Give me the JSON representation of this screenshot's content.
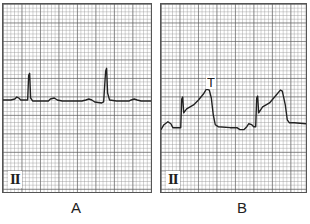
{
  "figure": {
    "panels": [
      {
        "id": "A",
        "caption": "A",
        "lead": "II",
        "trace_description": "Normal sinus rhythm: flat baseline with narrow QRS spikes, small P and T waves",
        "trace_points": "0,97 8,97 12,96 14,94 16,95 18,97 23,97 25,97 26,72 27,70 28,95 30,98 36,98 46,98 48,96 52,95 55,97 60,98 80,98 84,97 87,96 90,97 93,99 100,100 102,99 104,68 105,65 106,90 108,97 115,98 128,98 130,97 133,96 136,97 140,98 150,98",
        "stroke": "#222222"
      },
      {
        "id": "B",
        "caption": "B",
        "lead": "II",
        "annotation": "T",
        "trace_description": "Peaked/hyperacute T waves: QRS spikes followed by elevated ST segments rising into tall broad T waves",
        "trace_points": "0,127 3,122 7,119 10,121 12,125 18,125 20,125 21,96 22,94 23,110 26,106 33,102 38,97 43,91 46,86 49,87 51,95 53,112 55,122 58,124 70,125 77,125 80,127 84,127 87,124 89,121 92,122 94,124 96,124 97,95 98,93 99,110 103,104 110,100 116,93 121,87 123,88 126,102 128,117 130,120 135,120 147,121",
        "stroke": "#222222"
      }
    ],
    "grid": {
      "minor_px": 3.7,
      "major_px": 18.5,
      "minor_color": "#9a9a9a",
      "major_color": "#5a5a5a"
    }
  }
}
